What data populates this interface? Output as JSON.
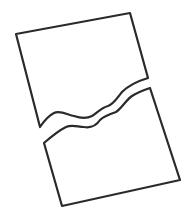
{
  "illustration": {
    "title": "Torn page",
    "icon": "torn-paper-icon",
    "stroke_color": "#2a2a2a",
    "background_color": "#ffffff",
    "pieces": [
      {
        "name": "top-piece"
      },
      {
        "name": "bottom-piece"
      }
    ]
  }
}
